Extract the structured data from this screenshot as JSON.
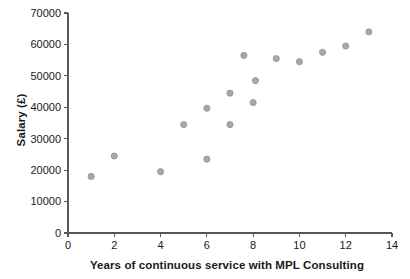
{
  "chart_data": {
    "type": "scatter",
    "title": "",
    "xlabel": "Years of continuous service with MPL Consulting",
    "ylabel": "Salary (£)",
    "xlim": [
      0,
      14
    ],
    "ylim": [
      0,
      70000
    ],
    "xticks": [
      0,
      2,
      4,
      6,
      8,
      10,
      12,
      14
    ],
    "xtick_labels": [
      "0",
      "2",
      "4",
      "6",
      "8",
      "10",
      "12",
      "14"
    ],
    "yticks": [
      0,
      10000,
      20000,
      30000,
      40000,
      50000,
      60000,
      70000
    ],
    "ytick_labels": [
      "0",
      "10000",
      "20000",
      "30000",
      "40000",
      "50000",
      "60000",
      "70000"
    ],
    "grid": false,
    "legend": null,
    "marker": "circle",
    "marker_color": "#a8a8aa",
    "points": [
      {
        "x": 1,
        "y": 18000
      },
      {
        "x": 2,
        "y": 24500
      },
      {
        "x": 4,
        "y": 19500
      },
      {
        "x": 5,
        "y": 34500
      },
      {
        "x": 6,
        "y": 23500
      },
      {
        "x": 6,
        "y": 39700
      },
      {
        "x": 7,
        "y": 34500
      },
      {
        "x": 7,
        "y": 44500
      },
      {
        "x": 7.6,
        "y": 56500
      },
      {
        "x": 8,
        "y": 41500
      },
      {
        "x": 8.1,
        "y": 48500
      },
      {
        "x": 9,
        "y": 55500
      },
      {
        "x": 10,
        "y": 54500
      },
      {
        "x": 11,
        "y": 57500
      },
      {
        "x": 12,
        "y": 59500
      },
      {
        "x": 13,
        "y": 64000
      }
    ]
  },
  "axes_geometry": {
    "x0_px": 68,
    "x1_px": 392,
    "y0_px": 233,
    "y1_px": 13,
    "tick_len": 4,
    "marker_radius": 3.1
  }
}
